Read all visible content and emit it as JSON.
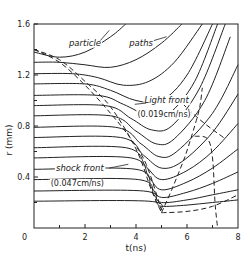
{
  "chart_data": {
    "type": "line",
    "title": "",
    "xlabel": "t(ns)",
    "ylabel": "r (mm)",
    "xlim": [
      0,
      8
    ],
    "ylim": [
      0,
      1.6
    ],
    "x_ticks": [
      0,
      2,
      4,
      6,
      8
    ],
    "x_tick_labels": [
      "0",
      "2",
      "4",
      "6",
      "8"
    ],
    "y_ticks": [
      0.4,
      0.8,
      1.2,
      1.6
    ],
    "y_tick_labels": [
      "0.4",
      "0.8",
      "1.2",
      "1.6"
    ],
    "origin_label": "0",
    "grid": false,
    "legend": null,
    "annotations": [
      {
        "text": "particle",
        "x": 2.0,
        "y": 1.43
      },
      {
        "text": "paths",
        "x": 4.2,
        "y": 1.43
      },
      {
        "text": "Light front",
        "x": 5.2,
        "y": 0.98
      },
      {
        "text": "(0.019cm/ns)",
        "x": 5.1,
        "y": 0.87
      },
      {
        "text": "shock front",
        "x": 1.8,
        "y": 0.45
      },
      {
        "text": "(0.047cm/ns)",
        "x": 1.7,
        "y": 0.33
      }
    ],
    "series": [
      {
        "name": "particle path r0=1.38",
        "style": "solid",
        "points": [
          [
            0,
            1.38
          ],
          [
            1,
            1.34
          ],
          [
            2,
            1.38
          ],
          [
            3,
            1.5
          ],
          [
            3.6,
            1.6
          ]
        ]
      },
      {
        "name": "particle path r0=1.30",
        "style": "solid",
        "points": [
          [
            0,
            1.3
          ],
          [
            1,
            1.3
          ],
          [
            2,
            1.28
          ],
          [
            3,
            1.26
          ],
          [
            4,
            1.32
          ],
          [
            5,
            1.45
          ],
          [
            5.8,
            1.6
          ]
        ]
      },
      {
        "name": "particle path r0=1.21",
        "style": "solid",
        "points": [
          [
            0,
            1.21
          ],
          [
            1.5,
            1.21
          ],
          [
            2.5,
            1.18
          ],
          [
            3.5,
            1.12
          ],
          [
            4.5,
            1.15
          ],
          [
            5.5,
            1.3
          ],
          [
            6.6,
            1.6
          ]
        ]
      },
      {
        "name": "particle path r0=1.13",
        "style": "solid",
        "points": [
          [
            0,
            1.13
          ],
          [
            2,
            1.13
          ],
          [
            3,
            1.08
          ],
          [
            4,
            1.0
          ],
          [
            5,
            1.0
          ],
          [
            6,
            1.2
          ],
          [
            7,
            1.6
          ]
        ]
      },
      {
        "name": "particle path r0=1.04",
        "style": "solid",
        "points": [
          [
            0,
            1.04
          ],
          [
            2.5,
            1.04
          ],
          [
            3.5,
            0.97
          ],
          [
            4.5,
            0.88
          ],
          [
            5.3,
            0.9
          ],
          [
            6.3,
            1.15
          ],
          [
            7.2,
            1.6
          ]
        ]
      },
      {
        "name": "particle path r0=0.96",
        "style": "solid",
        "points": [
          [
            0,
            0.96
          ],
          [
            2.8,
            0.96
          ],
          [
            3.8,
            0.86
          ],
          [
            4.6,
            0.77
          ],
          [
            5.4,
            0.8
          ],
          [
            6.5,
            1.1
          ],
          [
            7.5,
            1.6
          ]
        ]
      },
      {
        "name": "particle path r0=0.88",
        "style": "solid",
        "points": [
          [
            0,
            0.88
          ],
          [
            3,
            0.88
          ],
          [
            4,
            0.76
          ],
          [
            4.8,
            0.66
          ],
          [
            5.5,
            0.7
          ],
          [
            6.7,
            1.0
          ],
          [
            7.7,
            1.5
          ]
        ]
      },
      {
        "name": "particle path r0=0.79",
        "style": "solid",
        "points": [
          [
            0,
            0.79
          ],
          [
            3.2,
            0.79
          ],
          [
            4.2,
            0.66
          ],
          [
            4.9,
            0.56
          ],
          [
            5.6,
            0.6
          ],
          [
            7,
            0.9
          ],
          [
            8,
            1.28
          ]
        ]
      },
      {
        "name": "particle path r0=0.71",
        "style": "solid",
        "points": [
          [
            0,
            0.71
          ],
          [
            3.4,
            0.71
          ],
          [
            4.3,
            0.57
          ],
          [
            5,
            0.47
          ],
          [
            5.8,
            0.52
          ],
          [
            7,
            0.75
          ],
          [
            8,
            1.05
          ]
        ]
      },
      {
        "name": "particle path r0=0.63",
        "style": "solid",
        "points": [
          [
            0,
            0.63
          ],
          [
            3.6,
            0.63
          ],
          [
            4.4,
            0.48
          ],
          [
            5,
            0.38
          ],
          [
            6,
            0.45
          ],
          [
            7,
            0.6
          ],
          [
            8,
            0.82
          ]
        ]
      },
      {
        "name": "particle path r0=0.55",
        "style": "solid",
        "points": [
          [
            0,
            0.55
          ],
          [
            3.8,
            0.55
          ],
          [
            4.5,
            0.4
          ],
          [
            5,
            0.3
          ],
          [
            6,
            0.36
          ],
          [
            7,
            0.47
          ],
          [
            8,
            0.62
          ]
        ]
      },
      {
        "name": "particle path r0=0.46",
        "style": "solid",
        "points": [
          [
            0,
            0.46
          ],
          [
            4,
            0.46
          ],
          [
            4.6,
            0.32
          ],
          [
            5,
            0.24
          ],
          [
            6,
            0.28
          ],
          [
            7,
            0.35
          ],
          [
            8,
            0.44
          ]
        ]
      },
      {
        "name": "particle path r0=0.38",
        "style": "solid",
        "points": [
          [
            0,
            0.38
          ],
          [
            4.1,
            0.38
          ],
          [
            4.7,
            0.26
          ],
          [
            5,
            0.2
          ],
          [
            6,
            0.22
          ],
          [
            7,
            0.26
          ],
          [
            8,
            0.3
          ]
        ]
      },
      {
        "name": "particle path r0=0.29",
        "style": "solid",
        "points": [
          [
            0,
            0.29
          ],
          [
            4.3,
            0.29
          ],
          [
            4.8,
            0.2
          ],
          [
            5,
            0.17
          ],
          [
            6,
            0.18
          ],
          [
            7,
            0.2
          ],
          [
            8,
            0.22
          ]
        ]
      },
      {
        "name": "particle path r0=0.21",
        "style": "solid",
        "points": [
          [
            0,
            0.21
          ],
          [
            4.5,
            0.21
          ],
          [
            5,
            0.14
          ]
        ]
      },
      {
        "name": "shock front",
        "style": "dashed",
        "points": [
          [
            0,
            1.4
          ],
          [
            1,
            1.32
          ],
          [
            2,
            1.15
          ],
          [
            3,
            0.95
          ],
          [
            4,
            0.62
          ],
          [
            4.6,
            0.3
          ],
          [
            5,
            0.12
          ]
        ]
      },
      {
        "name": "light front",
        "style": "dashed",
        "points": [
          [
            0,
            1.4
          ],
          [
            1,
            1.3
          ],
          [
            2,
            1.12
          ],
          [
            3,
            0.9
          ],
          [
            3.8,
            0.7
          ],
          [
            4.4,
            0.5
          ],
          [
            5,
            0.14
          ]
        ]
      },
      {
        "name": "reflected front",
        "style": "dashed",
        "points": [
          [
            5,
            0.12
          ],
          [
            5.4,
            0.3
          ],
          [
            5.9,
            0.55
          ],
          [
            6.3,
            0.8
          ],
          [
            6.5,
            0.95
          ],
          [
            6.6,
            1.1
          ]
        ]
      },
      {
        "name": "light reflect",
        "style": "dashed",
        "points": [
          [
            5.6,
            1.02
          ],
          [
            6.5,
            0.85
          ],
          [
            7.5,
            0.7
          ]
        ]
      },
      {
        "name": "rarefaction",
        "style": "dashed",
        "points": [
          [
            6.3,
            0.72
          ],
          [
            6.8,
            0.7
          ],
          [
            7.0,
            0.55
          ],
          [
            7.1,
            0.2
          ],
          [
            7.2,
            0.0
          ]
        ]
      },
      {
        "name": "base dashed",
        "style": "dashed",
        "points": [
          [
            5,
            0.12
          ],
          [
            6,
            0.13
          ],
          [
            7,
            0.17
          ],
          [
            8,
            0.26
          ]
        ]
      }
    ]
  }
}
